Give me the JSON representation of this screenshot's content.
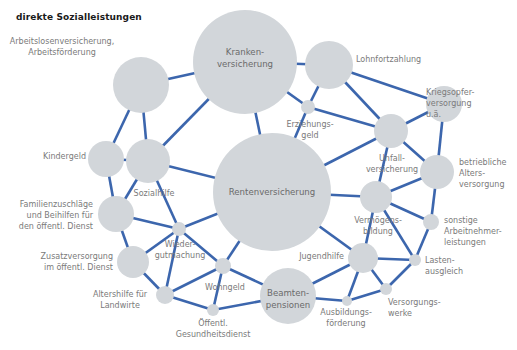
{
  "title": "direkte Sozialleistungen",
  "colors": {
    "edge": "#3c66ad",
    "node": "#d2d6da",
    "label": "#7a7a7a",
    "title": "#1a1a1a"
  },
  "nodes": [
    {
      "id": "kranken",
      "label": [
        "Kranken-",
        "versicherung"
      ],
      "cx": 245,
      "cy": 62,
      "r": 52,
      "label_pos": "inside",
      "lx": 245,
      "ly": 61,
      "anchor": "middle"
    },
    {
      "id": "arbeitslos",
      "label": [
        "Arbeitslosenversicherung,",
        "Arbeitsförderung"
      ],
      "cx": 141,
      "cy": 85,
      "r": 28,
      "label_pos": "outside",
      "lx": 62,
      "ly": 44,
      "anchor": "middle"
    },
    {
      "id": "lohn",
      "label": [
        "Lohnfortzahlung"
      ],
      "cx": 329,
      "cy": 65,
      "r": 24,
      "label_pos": "outside",
      "lx": 356,
      "ly": 62,
      "anchor": "start"
    },
    {
      "id": "kriegsopfer",
      "label": [
        "Kriegsopfer-",
        "versorgung",
        "u.ä."
      ],
      "cx": 444,
      "cy": 104,
      "r": 18,
      "label_pos": "outside",
      "lx": 426,
      "ly": 95,
      "anchor": "start"
    },
    {
      "id": "erziehung",
      "label": [
        "Erziehungs-",
        "geld"
      ],
      "cx": 308,
      "cy": 107,
      "r": 7,
      "label_pos": "outside",
      "lx": 310,
      "ly": 127,
      "anchor": "middle"
    },
    {
      "id": "unfall",
      "label": [
        "Unfall-",
        "versicherung"
      ],
      "cx": 391,
      "cy": 131,
      "r": 17,
      "label_pos": "outside",
      "lx": 392,
      "ly": 161,
      "anchor": "middle"
    },
    {
      "id": "kindergeld",
      "label": [
        "Kindergeld"
      ],
      "cx": 106,
      "cy": 159,
      "r": 18,
      "label_pos": "outside",
      "lx": 86,
      "ly": 159,
      "anchor": "end"
    },
    {
      "id": "sozialhilfe",
      "label": [
        "Sozialhilfe"
      ],
      "cx": 148,
      "cy": 161,
      "r": 22,
      "label_pos": "outside",
      "lx": 154,
      "ly": 196,
      "anchor": "middle"
    },
    {
      "id": "rente",
      "label": [
        "Rentenversicherung"
      ],
      "cx": 272,
      "cy": 192,
      "r": 59,
      "label_pos": "inside",
      "lx": 272,
      "ly": 195,
      "anchor": "middle"
    },
    {
      "id": "betrieblich",
      "label": [
        "betriebliche",
        "Alters-",
        "versorgung"
      ],
      "cx": 437,
      "cy": 172,
      "r": 17,
      "label_pos": "outside",
      "lx": 459,
      "ly": 165,
      "anchor": "start"
    },
    {
      "id": "familien",
      "label": [
        "Familienzuschläge",
        "und Beihilfen für",
        "den öffentl. Dienst"
      ],
      "cx": 116,
      "cy": 214,
      "r": 18,
      "label_pos": "outside",
      "lx": 93,
      "ly": 207,
      "anchor": "end"
    },
    {
      "id": "vermoegen",
      "label": [
        "Vermögens-",
        "bildung"
      ],
      "cx": 376,
      "cy": 197,
      "r": 16,
      "label_pos": "outside",
      "lx": 378,
      "ly": 223,
      "anchor": "middle"
    },
    {
      "id": "sonstige",
      "label": [
        "sonstige",
        "Arbeitnehmer-",
        "leistungen"
      ],
      "cx": 431,
      "cy": 222,
      "r": 8,
      "label_pos": "outside",
      "lx": 444,
      "ly": 223,
      "anchor": "start"
    },
    {
      "id": "wieder",
      "label": [
        "Wieder-",
        "gutmachung"
      ],
      "cx": 179,
      "cy": 229,
      "r": 7,
      "label_pos": "outside",
      "lx": 180,
      "ly": 247,
      "anchor": "middle"
    },
    {
      "id": "zusatz",
      "label": [
        "Zusatzversorgung",
        "im öffentl. Dienst"
      ],
      "cx": 133,
      "cy": 262,
      "r": 16,
      "label_pos": "outside",
      "lx": 113,
      "ly": 259,
      "anchor": "end"
    },
    {
      "id": "jugend",
      "label": [
        "Jugendhilfe"
      ],
      "cx": 363,
      "cy": 258,
      "r": 15,
      "label_pos": "outside",
      "lx": 344,
      "ly": 259,
      "anchor": "end"
    },
    {
      "id": "lasten",
      "label": [
        "Lasten-",
        "ausgleich"
      ],
      "cx": 415,
      "cy": 260,
      "r": 6,
      "label_pos": "outside",
      "lx": 425,
      "ly": 263,
      "anchor": "start"
    },
    {
      "id": "wohngeld",
      "label": [
        "Wohngeld"
      ],
      "cx": 223,
      "cy": 266,
      "r": 8,
      "label_pos": "outside",
      "lx": 225,
      "ly": 290,
      "anchor": "middle"
    },
    {
      "id": "altershilfe",
      "label": [
        "Altershilfe für",
        "Landwirte"
      ],
      "cx": 165,
      "cy": 295,
      "r": 9,
      "label_pos": "outside",
      "lx": 120,
      "ly": 297,
      "anchor": "middle"
    },
    {
      "id": "beamten",
      "label": [
        "Beamten-",
        "pensionen"
      ],
      "cx": 288,
      "cy": 296,
      "r": 28,
      "label_pos": "inside",
      "lx": 288,
      "ly": 302,
      "anchor": "middle"
    },
    {
      "id": "versorgung",
      "label": [
        "Versorgungs-",
        "werke"
      ],
      "cx": 386,
      "cy": 289,
      "r": 6,
      "label_pos": "outside",
      "lx": 388,
      "ly": 305,
      "anchor": "start"
    },
    {
      "id": "gesundheit",
      "label": [
        "Öffentl.",
        "Gesundheitsdienst"
      ],
      "cx": 213,
      "cy": 310,
      "r": 6,
      "label_pos": "outside",
      "lx": 213,
      "ly": 326,
      "anchor": "middle"
    },
    {
      "id": "ausbildung",
      "label": [
        "Ausbildungs-",
        "förderung"
      ],
      "cx": 347,
      "cy": 301,
      "r": 5,
      "label_pos": "outside",
      "lx": 346,
      "ly": 315,
      "anchor": "middle"
    }
  ],
  "edges": [
    [
      "kranken",
      "arbeitslos"
    ],
    [
      "kranken",
      "lohn"
    ],
    [
      "kranken",
      "rente"
    ],
    [
      "kranken",
      "sozialhilfe"
    ],
    [
      "kranken",
      "erziehung"
    ],
    [
      "arbeitslos",
      "kindergeld"
    ],
    [
      "arbeitslos",
      "sozialhilfe"
    ],
    [
      "lohn",
      "kriegsopfer"
    ],
    [
      "lohn",
      "erziehung"
    ],
    [
      "lohn",
      "unfall"
    ],
    [
      "kriegsopfer",
      "unfall"
    ],
    [
      "kriegsopfer",
      "betrieblich"
    ],
    [
      "erziehung",
      "unfall"
    ],
    [
      "erziehung",
      "rente"
    ],
    [
      "unfall",
      "rente"
    ],
    [
      "unfall",
      "betrieblich"
    ],
    [
      "unfall",
      "vermoegen"
    ],
    [
      "kindergeld",
      "sozialhilfe"
    ],
    [
      "kindergeld",
      "familien"
    ],
    [
      "sozialhilfe",
      "rente"
    ],
    [
      "sozialhilfe",
      "familien"
    ],
    [
      "sozialhilfe",
      "wieder"
    ],
    [
      "rente",
      "vermoegen"
    ],
    [
      "rente",
      "wieder"
    ],
    [
      "rente",
      "wohngeld"
    ],
    [
      "rente",
      "jugend"
    ],
    [
      "betrieblich",
      "vermoegen"
    ],
    [
      "betrieblich",
      "sonstige"
    ],
    [
      "vermoegen",
      "sonstige"
    ],
    [
      "vermoegen",
      "lasten"
    ],
    [
      "vermoegen",
      "jugend"
    ],
    [
      "sonstige",
      "lasten"
    ],
    [
      "familien",
      "wieder"
    ],
    [
      "familien",
      "zusatz"
    ],
    [
      "wieder",
      "zusatz"
    ],
    [
      "wieder",
      "wohngeld"
    ],
    [
      "wieder",
      "altershilfe"
    ],
    [
      "zusatz",
      "altershilfe"
    ],
    [
      "jugend",
      "lasten"
    ],
    [
      "jugend",
      "beamten"
    ],
    [
      "jugend",
      "versorgung"
    ],
    [
      "jugend",
      "ausbildung"
    ],
    [
      "lasten",
      "versorgung"
    ],
    [
      "wohngeld",
      "altershilfe"
    ],
    [
      "wohngeld",
      "gesundheit"
    ],
    [
      "wohngeld",
      "beamten"
    ],
    [
      "altershilfe",
      "gesundheit"
    ],
    [
      "gesundheit",
      "beamten"
    ],
    [
      "beamten",
      "ausbildung"
    ],
    [
      "ausbildung",
      "versorgung"
    ]
  ]
}
